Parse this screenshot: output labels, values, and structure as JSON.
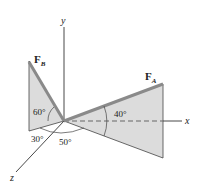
{
  "diagram": {
    "axes": {
      "x_label": "x",
      "y_label": "y",
      "z_label": "z"
    },
    "forces": [
      {
        "symbol": "F",
        "subscript": "A"
      },
      {
        "symbol": "F",
        "subscript": "B"
      }
    ],
    "angles": {
      "fa_from_x": "40°",
      "fb_from_plane": "60°",
      "fb_plane_from_z": "30°",
      "fa_plane_from_z": "50°"
    },
    "colors": {
      "shade": "#d9d9d9",
      "force": "#8a8a8a",
      "line": "#333333"
    }
  }
}
